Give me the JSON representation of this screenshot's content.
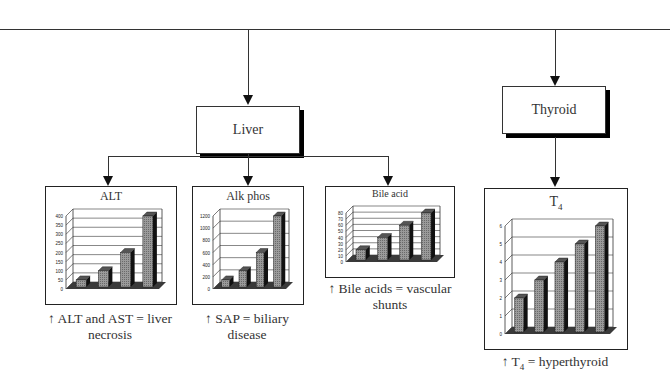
{
  "diagram": {
    "nodes": {
      "liver": {
        "label": "Liver"
      },
      "thyroid": {
        "label": "Thyroid"
      }
    },
    "captions": {
      "alt": {
        "line1": "↑ ALT and AST = liver",
        "line2": "necrosis"
      },
      "alkphos": {
        "line1": "↑ SAP = biliary",
        "line2": "disease"
      },
      "bile": {
        "line1": "↑ Bile acids = vascular",
        "line2": "shunts"
      },
      "t4": {
        "prefix": "↑ T",
        "sub": "4",
        "suffix": " = hyperthyroid"
      }
    }
  },
  "chart_data": [
    {
      "id": "alt",
      "type": "bar",
      "title": "ALT",
      "categories": [
        "1",
        "2",
        "3",
        "4"
      ],
      "values": [
        50,
        100,
        200,
        400
      ],
      "yticks": [
        0,
        50,
        100,
        150,
        200,
        250,
        300,
        350,
        400
      ],
      "ylim": [
        0,
        400
      ],
      "grid": true,
      "style": "3d"
    },
    {
      "id": "alkphos",
      "type": "bar",
      "title": "Alk phos",
      "categories": [
        "1",
        "2",
        "3",
        "4"
      ],
      "values": [
        150,
        300,
        600,
        1200
      ],
      "yticks": [
        0,
        200,
        400,
        600,
        800,
        1000,
        1200
      ],
      "ylim": [
        0,
        1200
      ],
      "grid": true,
      "style": "3d"
    },
    {
      "id": "bile",
      "type": "bar",
      "title": "Bile acid",
      "categories": [
        "1",
        "2",
        "3",
        "4"
      ],
      "values": [
        20,
        40,
        60,
        80
      ],
      "yticks": [
        0,
        10,
        20,
        30,
        40,
        50,
        60,
        70,
        80
      ],
      "ylim": [
        0,
        80
      ],
      "grid": true,
      "style": "3d"
    },
    {
      "id": "t4",
      "type": "bar",
      "title": "T4",
      "title_main": "T",
      "title_sub": "4",
      "categories": [
        "1",
        "2",
        "3",
        "4",
        "5"
      ],
      "values": [
        2,
        3,
        4,
        5,
        6
      ],
      "yticks": [
        0,
        1,
        2,
        3,
        4,
        5,
        6
      ],
      "ylim": [
        0,
        6
      ],
      "grid": true,
      "style": "3d"
    }
  ],
  "colors": {
    "line": "#333333",
    "bar_face": "#9a9a9a",
    "bar_side": "#111111",
    "floor": "#3a3a3a",
    "shadow": "#000000"
  }
}
